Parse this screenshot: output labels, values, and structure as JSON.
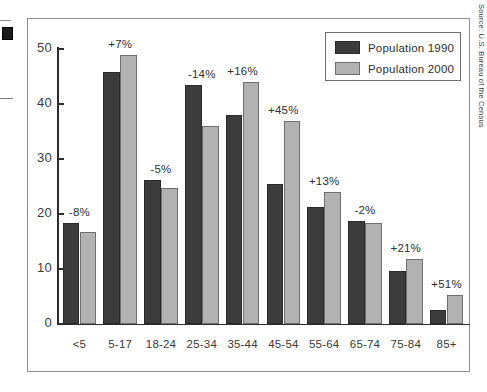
{
  "chart_data": {
    "type": "bar",
    "title": "",
    "xlabel": "",
    "ylabel": "",
    "ylim": [
      0,
      50
    ],
    "yticks": [
      0,
      10,
      20,
      30,
      40,
      50
    ],
    "grid": false,
    "legend_position": "top-right",
    "categories": [
      "<5",
      "5-17",
      "18-24",
      "25-34",
      "35-44",
      "45-54",
      "55-64",
      "65-74",
      "75-84",
      "85+"
    ],
    "series": [
      {
        "name": "Population 1990",
        "color": "#3c3c3c",
        "values": [
          18.3,
          45.9,
          26.2,
          43.5,
          38.0,
          25.4,
          21.2,
          18.8,
          9.7,
          2.5
        ]
      },
      {
        "name": "Population 2000",
        "color": "#b2b2b2",
        "values": [
          16.8,
          49.0,
          24.8,
          36.0,
          44.0,
          36.9,
          24.0,
          18.4,
          11.8,
          5.2
        ]
      }
    ],
    "annotations": [
      "-8%",
      "+7%",
      "-5%",
      "-14%",
      "+16%",
      "+45%",
      "+13%",
      "-2%",
      "+21%",
      "+51%"
    ],
    "source": "Source: U.S. Bureau of the Census"
  },
  "legend": {
    "items": [
      {
        "label": "Population 1990"
      },
      {
        "label": "Population 2000"
      }
    ]
  }
}
